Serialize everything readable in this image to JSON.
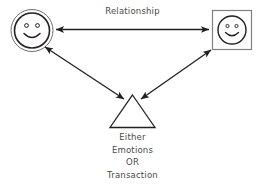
{
  "diagram": {
    "title_label": "Relationship",
    "nodes": {
      "left_person": {
        "name": "person-circle",
        "shape": "double-circle",
        "face": "smiley",
        "stroke": "#231f20"
      },
      "right_person": {
        "name": "person-square",
        "shape": "square",
        "face": "smiley",
        "stroke": "#231f20",
        "box_stroke": "#808080"
      },
      "exchange": {
        "name": "exchange-triangle",
        "shape": "triangle",
        "stroke": "#231f20"
      }
    },
    "caption": {
      "line1": "Either",
      "line2": "Emotions",
      "line3": "OR",
      "line4": "Transaction"
    },
    "connectors": {
      "top": {
        "label": "Relationship",
        "type": "double-headed-arrow"
      },
      "left": {
        "type": "double-headed-arrow"
      },
      "right": {
        "type": "double-headed-arrow"
      }
    },
    "colors": {
      "line": "#231f20",
      "text": "#4a4a4a",
      "box_border": "#808080",
      "background": "#ffffff"
    }
  }
}
